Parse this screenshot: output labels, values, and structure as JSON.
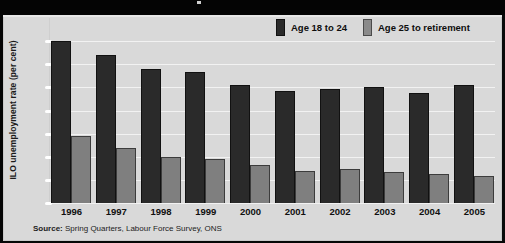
{
  "chart_data": {
    "type": "bar",
    "title": "",
    "xlabel": "",
    "ylabel": "ILO unemployment rate (per cent)",
    "categories": [
      "1996",
      "1997",
      "1998",
      "1999",
      "2000",
      "2001",
      "2002",
      "2003",
      "2004",
      "2005"
    ],
    "series": [
      {
        "name": "Age 18 to 24",
        "color": "#2a2a2a",
        "values": [
          17.5,
          16.0,
          14.5,
          14.2,
          12.8,
          12.1,
          12.3,
          12.5,
          11.9,
          12.8
        ]
      },
      {
        "name": "Age 25 to retirement",
        "color": "#7f7f7f",
        "values": [
          7.2,
          6.0,
          5.0,
          4.8,
          4.1,
          3.5,
          3.7,
          3.3,
          3.1,
          2.9
        ]
      }
    ],
    "ylim": [
      0,
      20
    ],
    "yticks": [
      0,
      2.5,
      5,
      7.5,
      10,
      12.5,
      15,
      17.5
    ],
    "grid": true,
    "legend_position": "top-right",
    "source_prefix": "Source:",
    "source_text": "Spring Quarters, Labour Force Survey, ONS"
  },
  "legend": {
    "items": [
      {
        "label": "Age 18 to 24",
        "swatch": "dark"
      },
      {
        "label": "Age 25 to retirement",
        "swatch": "grey"
      }
    ]
  },
  "colors": {
    "panel_background": "#d9d9d9",
    "frame": "#050505",
    "gridline": "#f2f2f2",
    "series_young": "#2a2a2a",
    "series_older": "#7f7f7f"
  }
}
